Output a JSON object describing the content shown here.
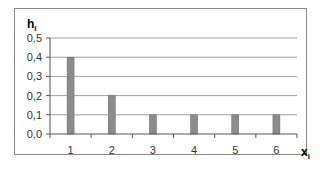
{
  "chart_data": {
    "type": "bar",
    "title": "",
    "xlabel": "x",
    "xlabel_subscript": "i",
    "ylabel": "h",
    "ylabel_subscript": "i",
    "categories": [
      "1",
      "2",
      "3",
      "4",
      "5",
      "6"
    ],
    "values": [
      0.4,
      0.2,
      0.1,
      0.1,
      0.1,
      0.1
    ],
    "ylim": [
      0.0,
      0.5
    ],
    "yticks": [
      "0,0",
      "0,1",
      "0,2",
      "0,3",
      "0,4",
      "0,5"
    ],
    "grid": true,
    "legend": null,
    "bar_color": "#8c8c8c",
    "grid_color": "#a0a0a0"
  }
}
